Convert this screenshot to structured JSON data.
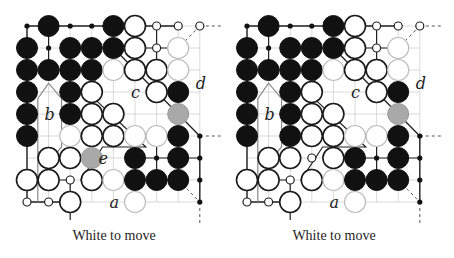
{
  "boards": [
    {
      "id": "left",
      "caption": "White to move",
      "offset_x": 0,
      "labels": [
        {
          "text": "b",
          "col": 1,
          "row": 4
        },
        {
          "text": "c",
          "col": 5,
          "row": 3
        },
        {
          "text": "d",
          "col": 8,
          "row": 2.6
        },
        {
          "text": "e",
          "col": 3.5,
          "row": 6
        },
        {
          "text": "a",
          "col": 4,
          "row": 8
        }
      ],
      "stones": [
        {
          "c": 1,
          "r": 0,
          "t": "B"
        },
        {
          "c": 4,
          "r": 0,
          "t": "B"
        },
        {
          "c": 5,
          "r": 0,
          "t": "W"
        },
        {
          "c": 0,
          "r": 1,
          "t": "B"
        },
        {
          "c": 2,
          "r": 1,
          "t": "B"
        },
        {
          "c": 3,
          "r": 1,
          "t": "B"
        },
        {
          "c": 4,
          "r": 1,
          "t": "B"
        },
        {
          "c": 5,
          "r": 1,
          "t": "W"
        },
        {
          "c": 7,
          "r": 1,
          "t": "Wf"
        },
        {
          "c": 0,
          "r": 2,
          "t": "B"
        },
        {
          "c": 1,
          "r": 2,
          "t": "B"
        },
        {
          "c": 2,
          "r": 2,
          "t": "B"
        },
        {
          "c": 3,
          "r": 2,
          "t": "B"
        },
        {
          "c": 4,
          "r": 2,
          "t": "Wf"
        },
        {
          "c": 5,
          "r": 2,
          "t": "W"
        },
        {
          "c": 6,
          "r": 2,
          "t": "W"
        },
        {
          "c": 7,
          "r": 2,
          "t": "Wf"
        },
        {
          "c": 0,
          "r": 3,
          "t": "B"
        },
        {
          "c": 2,
          "r": 3,
          "t": "B"
        },
        {
          "c": 3,
          "r": 3,
          "t": "W"
        },
        {
          "c": 6,
          "r": 3,
          "t": "W"
        },
        {
          "c": 7,
          "r": 3,
          "t": "B"
        },
        {
          "c": 0,
          "r": 4,
          "t": "B"
        },
        {
          "c": 2,
          "r": 4,
          "t": "B"
        },
        {
          "c": 3,
          "r": 4,
          "t": "W"
        },
        {
          "c": 4,
          "r": 4,
          "t": "W"
        },
        {
          "c": 7,
          "r": 4,
          "t": "G"
        },
        {
          "c": 0,
          "r": 5,
          "t": "B"
        },
        {
          "c": 2,
          "r": 5,
          "t": "Wf"
        },
        {
          "c": 3,
          "r": 5,
          "t": "W"
        },
        {
          "c": 4,
          "r": 5,
          "t": "W"
        },
        {
          "c": 5,
          "r": 5,
          "t": "Wf"
        },
        {
          "c": 6,
          "r": 5,
          "t": "Wf"
        },
        {
          "c": 7,
          "r": 5,
          "t": "B"
        },
        {
          "c": 1,
          "r": 6,
          "t": "W"
        },
        {
          "c": 2,
          "r": 6,
          "t": "W"
        },
        {
          "c": 3,
          "r": 6,
          "t": "G"
        },
        {
          "c": 5,
          "r": 6,
          "t": "B"
        },
        {
          "c": 7,
          "r": 6,
          "t": "B"
        },
        {
          "c": 0,
          "r": 7,
          "t": "W"
        },
        {
          "c": 1,
          "r": 7,
          "t": "W"
        },
        {
          "c": 3,
          "r": 7,
          "t": "W"
        },
        {
          "c": 4,
          "r": 7,
          "t": "Wf"
        },
        {
          "c": 5,
          "r": 7,
          "t": "B"
        },
        {
          "c": 6,
          "r": 7,
          "t": "B"
        },
        {
          "c": 7,
          "r": 7,
          "t": "B"
        },
        {
          "c": 2,
          "r": 8,
          "t": "W"
        },
        {
          "c": 5,
          "r": 8,
          "t": "Wf"
        }
      ],
      "dots": [
        {
          "c": 0,
          "r": 0,
          "t": "b"
        },
        {
          "c": 2,
          "r": 0,
          "t": "b"
        },
        {
          "c": 3,
          "r": 0,
          "t": "b"
        },
        {
          "c": 6,
          "r": 0,
          "t": "w"
        },
        {
          "c": 7,
          "r": 0,
          "t": "w"
        },
        {
          "c": 8,
          "r": 0,
          "t": "w"
        },
        {
          "c": 1,
          "r": 1,
          "t": "b"
        },
        {
          "c": 6,
          "r": 1,
          "t": "w"
        },
        {
          "c": 8,
          "r": 5,
          "t": "b"
        },
        {
          "c": 8,
          "r": 6,
          "t": "b"
        },
        {
          "c": 8,
          "r": 7,
          "t": "b"
        },
        {
          "c": 8,
          "r": 8,
          "t": "b"
        },
        {
          "c": 6,
          "r": 6,
          "t": "b"
        },
        {
          "c": 2,
          "r": 7,
          "t": "w"
        },
        {
          "c": 0,
          "r": 8,
          "t": "w"
        },
        {
          "c": 1,
          "r": 8,
          "t": "w"
        }
      ]
    },
    {
      "id": "right",
      "caption": "White to move",
      "offset_x": 220,
      "labels": [
        {
          "text": "b",
          "col": 1,
          "row": 4
        },
        {
          "text": "c",
          "col": 5,
          "row": 3
        },
        {
          "text": "d",
          "col": 8,
          "row": 2.6
        },
        {
          "text": "a",
          "col": 4,
          "row": 8
        }
      ],
      "stones": [
        {
          "c": 1,
          "r": 0,
          "t": "B"
        },
        {
          "c": 4,
          "r": 0,
          "t": "B"
        },
        {
          "c": 5,
          "r": 0,
          "t": "W"
        },
        {
          "c": 0,
          "r": 1,
          "t": "B"
        },
        {
          "c": 2,
          "r": 1,
          "t": "B"
        },
        {
          "c": 3,
          "r": 1,
          "t": "B"
        },
        {
          "c": 4,
          "r": 1,
          "t": "B"
        },
        {
          "c": 5,
          "r": 1,
          "t": "W"
        },
        {
          "c": 7,
          "r": 1,
          "t": "Wf"
        },
        {
          "c": 0,
          "r": 2,
          "t": "B"
        },
        {
          "c": 1,
          "r": 2,
          "t": "B"
        },
        {
          "c": 2,
          "r": 2,
          "t": "B"
        },
        {
          "c": 3,
          "r": 2,
          "t": "B"
        },
        {
          "c": 4,
          "r": 2,
          "t": "Wf"
        },
        {
          "c": 5,
          "r": 2,
          "t": "W"
        },
        {
          "c": 6,
          "r": 2,
          "t": "W"
        },
        {
          "c": 7,
          "r": 2,
          "t": "Wf"
        },
        {
          "c": 0,
          "r": 3,
          "t": "B"
        },
        {
          "c": 2,
          "r": 3,
          "t": "B"
        },
        {
          "c": 3,
          "r": 3,
          "t": "W"
        },
        {
          "c": 6,
          "r": 3,
          "t": "W"
        },
        {
          "c": 7,
          "r": 3,
          "t": "B"
        },
        {
          "c": 0,
          "r": 4,
          "t": "B"
        },
        {
          "c": 2,
          "r": 4,
          "t": "B"
        },
        {
          "c": 3,
          "r": 4,
          "t": "W"
        },
        {
          "c": 4,
          "r": 4,
          "t": "W"
        },
        {
          "c": 7,
          "r": 4,
          "t": "G"
        },
        {
          "c": 0,
          "r": 5,
          "t": "B"
        },
        {
          "c": 2,
          "r": 5,
          "t": "B"
        },
        {
          "c": 3,
          "r": 5,
          "t": "W"
        },
        {
          "c": 4,
          "r": 5,
          "t": "W"
        },
        {
          "c": 5,
          "r": 5,
          "t": "Wf"
        },
        {
          "c": 6,
          "r": 5,
          "t": "Wf"
        },
        {
          "c": 7,
          "r": 5,
          "t": "B"
        },
        {
          "c": 1,
          "r": 6,
          "t": "W"
        },
        {
          "c": 2,
          "r": 6,
          "t": "W"
        },
        {
          "c": 4,
          "r": 6,
          "t": "W"
        },
        {
          "c": 5,
          "r": 6,
          "t": "B"
        },
        {
          "c": 7,
          "r": 6,
          "t": "B"
        },
        {
          "c": 0,
          "r": 7,
          "t": "W"
        },
        {
          "c": 1,
          "r": 7,
          "t": "W"
        },
        {
          "c": 3,
          "r": 7,
          "t": "W"
        },
        {
          "c": 4,
          "r": 7,
          "t": "Wf"
        },
        {
          "c": 5,
          "r": 7,
          "t": "B"
        },
        {
          "c": 6,
          "r": 7,
          "t": "B"
        },
        {
          "c": 7,
          "r": 7,
          "t": "B"
        },
        {
          "c": 2,
          "r": 8,
          "t": "W"
        },
        {
          "c": 5,
          "r": 8,
          "t": "Wf"
        }
      ],
      "dots": [
        {
          "c": 0,
          "r": 0,
          "t": "b"
        },
        {
          "c": 2,
          "r": 0,
          "t": "b"
        },
        {
          "c": 3,
          "r": 0,
          "t": "b"
        },
        {
          "c": 6,
          "r": 0,
          "t": "w"
        },
        {
          "c": 7,
          "r": 0,
          "t": "w"
        },
        {
          "c": 8,
          "r": 0,
          "t": "w"
        },
        {
          "c": 1,
          "r": 1,
          "t": "b"
        },
        {
          "c": 6,
          "r": 1,
          "t": "w"
        },
        {
          "c": 3,
          "r": 6,
          "t": "w"
        },
        {
          "c": 6,
          "r": 6,
          "t": "b"
        },
        {
          "c": 8,
          "r": 5,
          "t": "b"
        },
        {
          "c": 8,
          "r": 6,
          "t": "b"
        },
        {
          "c": 8,
          "r": 7,
          "t": "b"
        },
        {
          "c": 8,
          "r": 8,
          "t": "b"
        },
        {
          "c": 2,
          "r": 7,
          "t": "w"
        },
        {
          "c": 0,
          "r": 8,
          "t": "w"
        },
        {
          "c": 1,
          "r": 8,
          "t": "w"
        }
      ]
    }
  ],
  "grid": {
    "cols": 9,
    "rows": 9,
    "x0": 27,
    "y0": 26,
    "dx": 21.6,
    "dy": 22,
    "stone_r": 10.5
  }
}
